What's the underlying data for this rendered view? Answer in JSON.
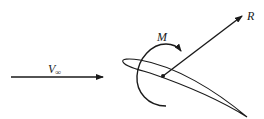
{
  "diagram": {
    "type": "airfoil-force-diagram",
    "labels": {
      "freestream": "V",
      "freestream_sub": "∞",
      "resultant": "R",
      "moment": "M"
    },
    "colors": {
      "stroke": "#1a1a1a",
      "background": "#ffffff"
    }
  }
}
